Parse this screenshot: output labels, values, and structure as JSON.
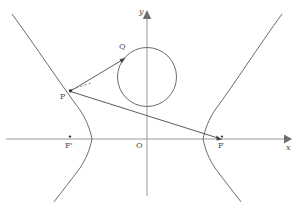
{
  "figure": {
    "type": "geometry-diagram",
    "background_color": "#ffffff",
    "curve_color": "#6b6b6b",
    "axis_color": "#9a9a9a",
    "ray_color": "#4a4a4a",
    "label_color": "#4c4c4c"
  },
  "axes": {
    "x_label": "x",
    "y_label": "y",
    "origin_label": "O",
    "x_axis_y_px": 139,
    "y_axis_x_px": 147,
    "x_axis_start_px": 6,
    "x_axis_end_px": 291,
    "y_axis_top_px": 12,
    "y_axis_bottom_px": 196
  },
  "points": [
    {
      "id": "P",
      "label": "P",
      "x_px": 70,
      "y_px": 91,
      "label_x_px": 60,
      "label_y_px": 93,
      "dot": true
    },
    {
      "id": "Q",
      "label": "Q",
      "x_px": 125,
      "y_px": 58,
      "label_x_px": 119,
      "label_y_px": 44,
      "dot": false
    },
    {
      "id": "F_prime",
      "label": "F'",
      "x_px": 70,
      "y_px": 139,
      "label_x_px": 65,
      "label_y_px": 142,
      "dot": true
    },
    {
      "id": "F",
      "label": "F",
      "x_px": 222,
      "y_px": 139,
      "label_x_px": 218,
      "label_y_px": 142,
      "dot": true
    },
    {
      "id": "O",
      "label": "O",
      "x_px": 147,
      "y_px": 139,
      "label_x_px": 137,
      "label_y_px": 142,
      "dot": false
    }
  ],
  "circle": {
    "center_x_px": 147,
    "center_y_px": 77,
    "radius_px": 29.5
  },
  "hyperbola": {
    "center_x_px": 147,
    "center_y_px": 139,
    "a_px": 55,
    "b_px": 62,
    "left_vertex_x_px": 92,
    "right_vertex_x_px": 203
  },
  "segments": [
    {
      "id": "PQ",
      "from": "P",
      "to": "Q",
      "style": "solid",
      "arrow_at_end": true
    },
    {
      "id": "PF",
      "from": "P",
      "to": "F",
      "style": "solid",
      "arrow_at_end": true
    },
    {
      "id": "P-tangent-hint",
      "from": "P",
      "to": "tangent",
      "style": "dashed",
      "arrow_at_end": false
    }
  ]
}
